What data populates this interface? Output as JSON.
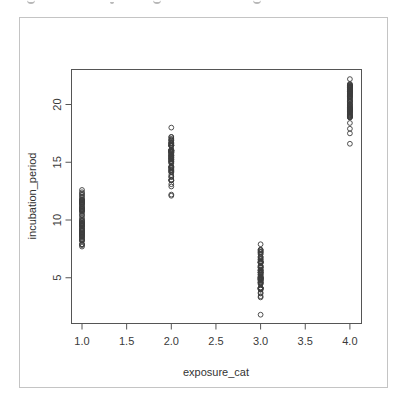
{
  "chart_data": {
    "type": "scatter",
    "title": "",
    "xlabel": "exposure_cat",
    "ylabel": "incubation_period",
    "xlim": [
      0.88,
      4.12
    ],
    "ylim": [
      1.0,
      22.8
    ],
    "x_ticks": [
      1.0,
      1.5,
      2.0,
      2.5,
      3.0,
      3.5,
      4.0
    ],
    "x_tick_labels": [
      "1.0",
      "1.5",
      "2.0",
      "2.5",
      "3.0",
      "3.5",
      "4.0"
    ],
    "y_ticks": [
      5,
      10,
      15,
      20
    ],
    "y_tick_labels": [
      "5",
      "10",
      "15",
      "20"
    ],
    "grid": false,
    "legend": null,
    "marker": "open-circle",
    "series": [
      {
        "name": "exposure_cat 1",
        "x": 1.0,
        "dense_range": [
          7.8,
          12.3
        ],
        "extra_points": [
          12.6,
          12.4,
          7.7,
          7.9,
          8.2
        ]
      },
      {
        "name": "exposure_cat 2",
        "x": 2.0,
        "dense_range": [
          13.4,
          17.2
        ],
        "extra_points": [
          18.0,
          13.1,
          12.9,
          12.2,
          12.1
        ]
      },
      {
        "name": "exposure_cat 3",
        "x": 3.0,
        "dense_range": [
          3.6,
          7.5
        ],
        "extra_points": [
          7.9,
          3.4,
          3.3,
          1.8
        ]
      },
      {
        "name": "exposure_cat 4",
        "x": 4.0,
        "dense_range": [
          18.8,
          21.8
        ],
        "extra_points": [
          22.2,
          18.4,
          17.9,
          17.5,
          16.6
        ]
      }
    ]
  },
  "colors": {
    "points": "#3c3c3c",
    "axes": "#555555",
    "frame": "#c4c4c4",
    "text": "#333333"
  }
}
